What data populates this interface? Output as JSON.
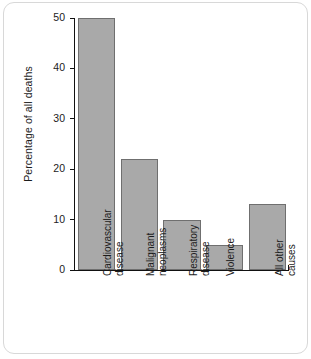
{
  "chart_data": {
    "type": "bar",
    "title": "",
    "xlabel": "",
    "ylabel": "Percentage of all deaths",
    "categories": [
      "Cardiovascular disease",
      "Malignant neoplasms",
      "Respiratory disease",
      "Violence",
      "All other causes"
    ],
    "category_lines": [
      [
        "Cardiovascular",
        "disease"
      ],
      [
        "Malignant",
        "neoplasms"
      ],
      [
        "Respiratory",
        "disease"
      ],
      [
        "Violence"
      ],
      [
        "All other",
        "causes"
      ]
    ],
    "values": [
      50,
      22,
      10,
      5,
      13
    ],
    "ylim": [
      0,
      50
    ],
    "yticks": [
      0,
      10,
      20,
      30,
      40,
      50
    ],
    "ytick_labels": [
      "0",
      "10",
      "20",
      "30",
      "40",
      "50"
    ],
    "grid": false,
    "legend": false,
    "bar_fill_color": "#a9a9a9",
    "bar_edge_color": "#6f6f6f",
    "axis_color": "#111111",
    "text_color": "#1c1c1c",
    "card_border_color": "#d8d8d8",
    "background_color": "#ffffff"
  }
}
